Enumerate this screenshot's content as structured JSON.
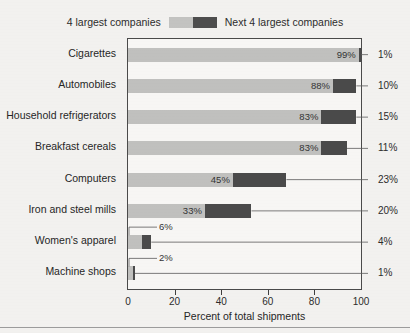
{
  "legend": {
    "left_label": "4 largest companies",
    "right_label": "Next 4 largest companies",
    "light_color": "#c3c3c1",
    "dark_color": "#4d4d4d"
  },
  "axis": {
    "title": "Percent of total shipments",
    "ticks": [
      "0",
      "20",
      "40",
      "60",
      "80",
      "100"
    ]
  },
  "chart_data": {
    "type": "bar",
    "orientation": "horizontal",
    "stacked": true,
    "title": "",
    "subtitle": "",
    "xlabel": "Percent of total shipments",
    "ylabel": "",
    "xlim": [
      0,
      100
    ],
    "xticks": [
      0,
      20,
      40,
      60,
      80,
      100
    ],
    "grid": false,
    "legend_position": "top-center",
    "categories": [
      "Cigarettes",
      "Automobiles",
      "Household refrigerators",
      "Breakfast cereals",
      "Computers",
      "Iron and steel mills",
      "Women's apparel",
      "Machine shops"
    ],
    "series": [
      {
        "name": "4 largest companies",
        "color": "#c0c0be",
        "values": [
          99,
          88,
          83,
          83,
          45,
          33,
          6,
          2
        ],
        "labels": [
          "99%",
          "88%",
          "83%",
          "83%",
          "45%",
          "33%",
          "6%",
          "2%"
        ]
      },
      {
        "name": "Next 4 largest companies",
        "color": "#4a4a4a",
        "values": [
          1,
          10,
          15,
          11,
          23,
          20,
          4,
          1
        ],
        "labels": [
          "1%",
          "10%",
          "15%",
          "11%",
          "23%",
          "20%",
          "4%",
          "1%"
        ]
      }
    ]
  }
}
